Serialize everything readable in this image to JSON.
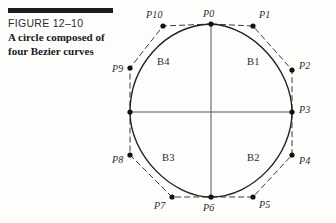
{
  "caption": {
    "figure_number": "FIGURE 12–10",
    "title": "A circle composed of four Bezier curves"
  },
  "colors": {
    "ink": "#1b1b1b",
    "curve": "#222222",
    "polygon": "#3a3a3a",
    "axis": "#555555",
    "background": "#fdfdfb"
  },
  "diagram": {
    "type": "bezier-circle",
    "circle": {
      "cx": 211,
      "cy": 112,
      "r": 81
    },
    "anchor_points": [
      "P0",
      "P3",
      "P6",
      "P9"
    ],
    "control_points": [
      "P1",
      "P2",
      "P4",
      "P5",
      "P7",
      "P8",
      "P10"
    ],
    "points": [
      {
        "id": "P0",
        "kind": "anchor",
        "x": 211,
        "y": 24,
        "label": "P0",
        "label_x": 203,
        "label_y": 8
      },
      {
        "id": "P1",
        "kind": "control",
        "x": 253,
        "y": 26,
        "label": "P1",
        "label_x": 259,
        "label_y": 9
      },
      {
        "id": "P2",
        "kind": "control",
        "x": 292,
        "y": 70,
        "label": "P2",
        "label_x": 299,
        "label_y": 60
      },
      {
        "id": "P3",
        "kind": "anchor",
        "x": 292,
        "y": 112,
        "label": "P3",
        "label_x": 299,
        "label_y": 104
      },
      {
        "id": "P4",
        "kind": "control",
        "x": 292,
        "y": 155,
        "label": "P4",
        "label_x": 299,
        "label_y": 155
      },
      {
        "id": "P5",
        "kind": "control",
        "x": 253,
        "y": 197,
        "label": "P5",
        "label_x": 259,
        "label_y": 199
      },
      {
        "id": "P6",
        "kind": "anchor",
        "x": 211,
        "y": 197,
        "label": "P6",
        "label_x": 203,
        "label_y": 202
      },
      {
        "id": "P7",
        "kind": "control",
        "x": 172,
        "y": 197,
        "label": "P7",
        "label_x": 154,
        "label_y": 200
      },
      {
        "id": "P8",
        "kind": "control",
        "x": 130,
        "y": 155,
        "label": "P8",
        "label_x": 112,
        "label_y": 154
      },
      {
        "id": "P9",
        "kind": "anchor",
        "x": 130,
        "y": 112,
        "label": "P9",
        "label_x": 112,
        "label_y": 63
      },
      {
        "id": "P10",
        "kind": "control",
        "x": 163,
        "y": 26,
        "label": "P10",
        "label_x": 146,
        "label_y": 9
      }
    ],
    "curve_labels": [
      {
        "id": "B1",
        "label": "B1",
        "x": 247,
        "y": 56
      },
      {
        "id": "B2",
        "label": "B2",
        "x": 247,
        "y": 152
      },
      {
        "id": "B3",
        "label": "B3",
        "x": 162,
        "y": 152
      },
      {
        "id": "B4",
        "label": "B4",
        "x": 157,
        "y": 56
      }
    ],
    "p9_dot": {
      "x": 130,
      "y": 68
    },
    "axes": {
      "horizontal": {
        "x1": 130,
        "y1": 112,
        "x2": 292,
        "y2": 112
      },
      "vertical": {
        "x1": 211,
        "y1": 24,
        "x2": 211,
        "y2": 197
      }
    }
  }
}
